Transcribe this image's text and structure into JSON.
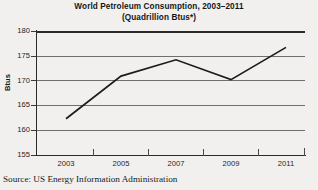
{
  "figure": {
    "title_line1": "World Petroleum Consumption, 2003–2011",
    "title_line2": "(Quadrillion Btus*)",
    "source": "Source: US Energy Information Administration",
    "series_color": "#1c1c1c",
    "grid_color": "#6e6e6e",
    "axis_color": "#2b2b2b",
    "background_color": "#f1f0ee"
  },
  "chart_data": {
    "type": "line",
    "title": "World Petroleum Consumption, 2003–2011 (Quadrillion Btus*)",
    "xlabel": "",
    "ylabel": "Btus",
    "x": [
      2003,
      2005,
      2007,
      2009,
      2011
    ],
    "values": [
      162.3,
      170.9,
      174.2,
      170.2,
      176.7
    ],
    "series": [
      {
        "name": "World Petroleum Consumption",
        "values": [
          162.3,
          170.9,
          174.2,
          170.2,
          176.7
        ]
      }
    ],
    "xlim": [
      2002,
      2012
    ],
    "ylim": [
      155,
      180
    ],
    "ytick_labels": [
      "180",
      "175",
      "170",
      "165",
      "160",
      "155"
    ],
    "ytick_values": [
      180,
      175,
      170,
      165,
      160,
      155
    ],
    "xtick_labels": [
      "2003",
      "2005",
      "2007",
      "2009",
      "2011"
    ],
    "minor_xtick_values": [
      2004,
      2006,
      2008,
      2010
    ],
    "grid": "horizontal",
    "legend": "none",
    "markers": "none"
  }
}
